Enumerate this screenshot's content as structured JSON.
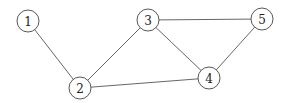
{
  "graph": {
    "nodes": [
      {
        "id": "1",
        "label": "1",
        "x": 28,
        "y": 21
      },
      {
        "id": "2",
        "label": "2",
        "x": 80,
        "y": 88
      },
      {
        "id": "3",
        "label": "3",
        "x": 148,
        "y": 20
      },
      {
        "id": "4",
        "label": "4",
        "x": 209,
        "y": 78
      },
      {
        "id": "5",
        "label": "5",
        "x": 262,
        "y": 19
      }
    ],
    "edges": [
      {
        "from": "1",
        "to": "2"
      },
      {
        "from": "2",
        "to": "3"
      },
      {
        "from": "2",
        "to": "4"
      },
      {
        "from": "3",
        "to": "4"
      },
      {
        "from": "3",
        "to": "5"
      },
      {
        "from": "4",
        "to": "5"
      }
    ],
    "node_radius": 11
  }
}
